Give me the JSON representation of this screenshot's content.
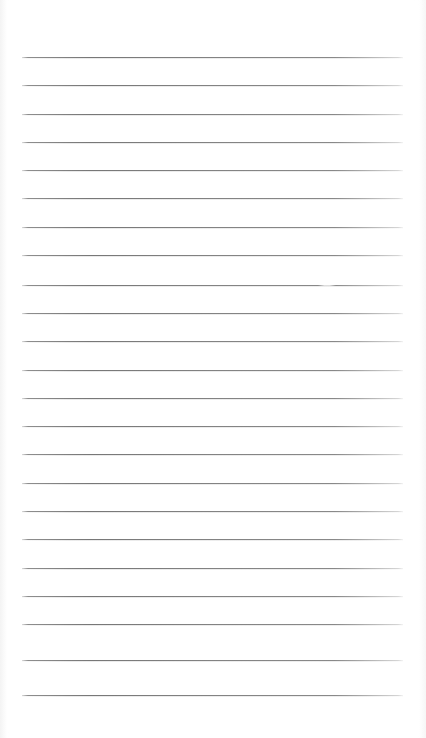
{
  "document": {
    "type": "ruled-paper-scan",
    "title": "Blank ruled notepad page",
    "page_width": 426,
    "page_height": 738,
    "background_color": "#ffffff",
    "written_content": "",
    "has_text": false
  },
  "ruling": {
    "line_count": 23,
    "line_color": "#7a7a7a",
    "line_thickness_px": 1,
    "line_spacing_px": 28.2,
    "left_margin_px": 22,
    "right_edge_px": 403,
    "line_length_px": 381,
    "first_line_y_px": 57,
    "last_line_y_px": 677,
    "top_blank_space_px": 57,
    "bottom_blank_space_px": 61,
    "orientation": "horizontal",
    "margin_rule": "none",
    "lines": [
      {
        "index": 1,
        "y": 57
      },
      {
        "index": 2,
        "y": 85
      },
      {
        "index": 3,
        "y": 114
      },
      {
        "index": 4,
        "y": 142
      },
      {
        "index": 5,
        "y": 170
      },
      {
        "index": 6,
        "y": 198
      },
      {
        "index": 7,
        "y": 227
      },
      {
        "index": 8,
        "y": 255
      },
      {
        "index": 9,
        "y": 285
      },
      {
        "index": 10,
        "y": 313
      },
      {
        "index": 11,
        "y": 341
      },
      {
        "index": 12,
        "y": 370
      },
      {
        "index": 13,
        "y": 398
      },
      {
        "index": 14,
        "y": 426
      },
      {
        "index": 15,
        "y": 454
      },
      {
        "index": 16,
        "y": 483
      },
      {
        "index": 17,
        "y": 511
      },
      {
        "index": 18,
        "y": 539
      },
      {
        "index": 19,
        "y": 568
      },
      {
        "index": 20,
        "y": 596
      },
      {
        "index": 21,
        "y": 624
      },
      {
        "index": 22,
        "y": 660
      },
      {
        "index": 23,
        "y": 695
      }
    ]
  },
  "artifacts": [
    {
      "name": "scan-gap-artifact",
      "description": "faint light interruption on a ruled line",
      "x": 318,
      "y": 284,
      "width": 18
    }
  ]
}
